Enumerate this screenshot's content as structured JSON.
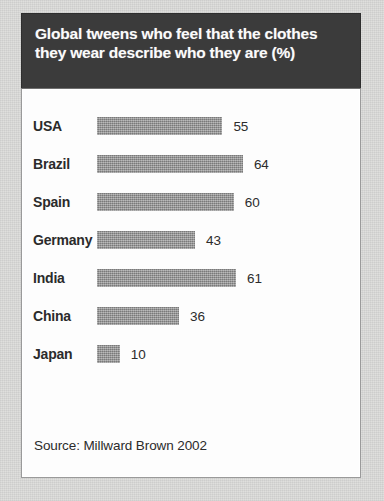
{
  "chart_data": {
    "type": "bar",
    "orientation": "horizontal",
    "title": "Global tweens who feel that the clothes they wear describe who they are (%)",
    "xlabel": "",
    "ylabel": "",
    "xlim": [
      0,
      70
    ],
    "grid": false,
    "legend": false,
    "source": "Source: Millward Brown 2002",
    "categories": [
      "USA",
      "Brazil",
      "Spain",
      "Germany",
      "India",
      "China",
      "Japan"
    ],
    "values": [
      55,
      64,
      60,
      43,
      61,
      36,
      10
    ],
    "bars": [
      {
        "category": "USA",
        "value": 55,
        "value_label": "55"
      },
      {
        "category": "Brazil",
        "value": 64,
        "value_label": "64"
      },
      {
        "category": "Spain",
        "value": 60,
        "value_label": "60"
      },
      {
        "category": "Germany",
        "value": 43,
        "value_label": "43"
      },
      {
        "category": "India",
        "value": 61,
        "value_label": "61"
      },
      {
        "category": "China",
        "value": 36,
        "value_label": "36"
      },
      {
        "category": "Japan",
        "value": 10,
        "value_label": "10"
      }
    ]
  },
  "colors": {
    "header_background": "#3b3b3b",
    "header_text": "#ffffff",
    "panel_background": "#fdfdfd",
    "bar_fill": "#939393",
    "label_text": "#2b2b2b",
    "page_background": "#dcdcda"
  }
}
